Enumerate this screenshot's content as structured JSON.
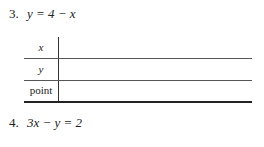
{
  "problems": [
    {
      "number": "3.",
      "equation": "y = 4 − x"
    },
    {
      "number": "4.",
      "equation": "3x − y = 2"
    }
  ],
  "table": {
    "rows": [
      {
        "label": "x",
        "values": []
      },
      {
        "label": "y",
        "values": []
      },
      {
        "label": "point",
        "values": []
      }
    ]
  }
}
